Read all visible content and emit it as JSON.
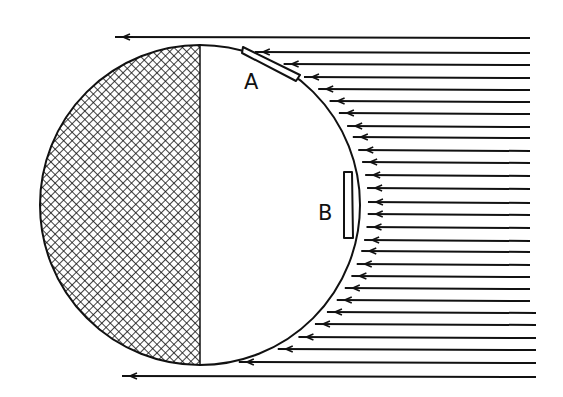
{
  "diagram": {
    "labels": [
      {
        "id": "A",
        "text": "A",
        "x": 244,
        "y": 72
      },
      {
        "id": "B",
        "text": "B",
        "x": 318,
        "y": 203
      }
    ],
    "colors": {
      "ink": "#111111",
      "background": "#ffffff"
    },
    "sphere": {
      "cx": 200,
      "cy": 205,
      "r": 160,
      "shaded_half": "left"
    },
    "panels": [
      {
        "id": "A",
        "position": "upper-right surface near top",
        "orientation": "tangent"
      },
      {
        "id": "B",
        "position": "right surface facing rays",
        "orientation": "perpendicular to rays"
      }
    ],
    "rays": {
      "direction": "right-to-left",
      "right_end_x": 530,
      "rows_y": [
        37,
        52,
        64,
        77,
        89,
        101,
        113,
        126,
        137,
        150,
        162,
        175,
        188,
        202,
        214,
        227,
        240,
        251,
        264,
        276,
        288,
        300,
        312,
        324,
        337,
        349,
        362,
        376
      ]
    }
  }
}
